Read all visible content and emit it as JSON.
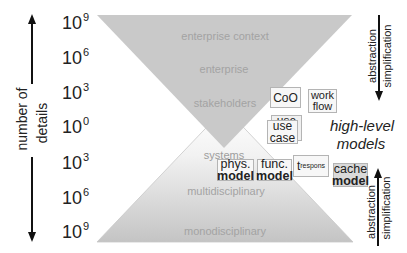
{
  "axis": {
    "title_line1": "number of",
    "title_line2": "details",
    "ticks": [
      {
        "base": "10",
        "exp": "9"
      },
      {
        "base": "10",
        "exp": "6"
      },
      {
        "base": "10",
        "exp": "3"
      },
      {
        "base": "10",
        "exp": "0"
      },
      {
        "base": "10",
        "exp": "3"
      },
      {
        "base": "10",
        "exp": "6"
      },
      {
        "base": "10",
        "exp": "9"
      }
    ]
  },
  "top_funnel": {
    "labels": [
      "enterprise context",
      "enterprise",
      "stakeholders"
    ]
  },
  "bottom_funnel": {
    "labels": [
      "systems",
      "multidisciplinary",
      "monodisciplinary"
    ]
  },
  "boxes": {
    "coo": {
      "line1": "CoO"
    },
    "workflow": {
      "line1": "work",
      "line2": "flow"
    },
    "use_case_back": {
      "line1": "use"
    },
    "use_case_front": {
      "line1": "use",
      "line2": "case"
    },
    "phys_model": {
      "line1": "phys.",
      "line2": "model"
    },
    "func_model": {
      "line1": "func.",
      "line2": "model"
    },
    "t_respons": {
      "main": "t",
      "sub": "respons"
    },
    "cache_model": {
      "line1": "cache",
      "line2": "model"
    }
  },
  "high_level_models": {
    "line1": "high-level",
    "line2": "models"
  },
  "right_arrows": {
    "top": {
      "label_left": "abstraction",
      "label_right": "simplification",
      "direction": "down"
    },
    "bottom": {
      "label_left": "abstraction",
      "label_right": "simplification",
      "direction": "up"
    }
  },
  "colors": {
    "funnel_gray": "#c9c9c9",
    "text_dark": "#222222",
    "zone_text": "#a3a3a3"
  }
}
